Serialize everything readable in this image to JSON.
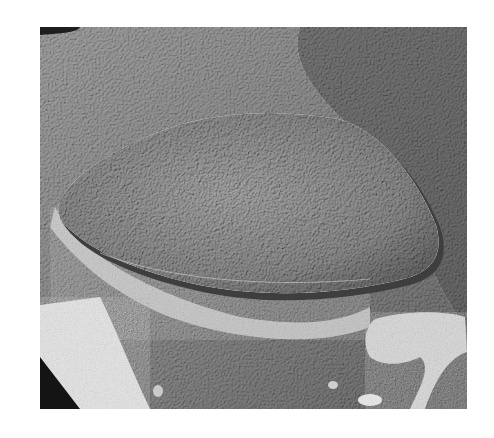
{
  "image": {
    "description": "Grayscale electron micrograph of an elongated oval textured body embedded in a fractured surface",
    "colors": {
      "background": "#ffffff",
      "surface_mid": "#8a8a8a",
      "surface_dark": "#5a5a5a",
      "oval_body": "#7e7e7e",
      "bright_patch": "#d6d6d6",
      "shadow": "#1e1e1e"
    }
  }
}
